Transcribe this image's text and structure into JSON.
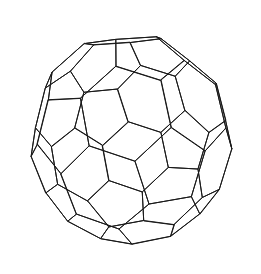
{
  "figure": {
    "name": "truncated-icosahedron-wireframe",
    "title": "Truncated icosahedron",
    "alt_names": [
      "buckyball",
      "soccer ball polyhedron",
      "C60 fullerene cage"
    ],
    "rendering": {
      "style": "line-drawing wireframe",
      "shading": "none",
      "hidden_lines": "visible",
      "background_color": "#ffffff",
      "stroke_color": "#1a1a1a",
      "stroke_width": 1,
      "canvas_width": 261,
      "canvas_height": 274
    },
    "geometry": {
      "solid": "truncated icosahedron",
      "vertices": 60,
      "edges": 90,
      "faces": 32,
      "hexagon_faces": 20,
      "pentagon_faces": 12,
      "circumscribed_radius": 1.0,
      "projection": "perspective",
      "camera_distance": 5.6,
      "focal_length": 4.9,
      "scale": 120,
      "center_x": 131,
      "center_y": 138,
      "rotation_x_deg": -14,
      "rotation_y_deg": 20,
      "rotation_z_deg": 7,
      "aspect_squeeze_x": 0.95,
      "aspect_squeeze_y": 1.0
    }
  }
}
